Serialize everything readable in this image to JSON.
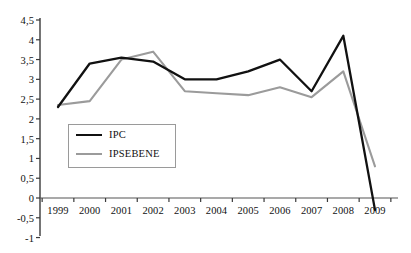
{
  "chart_data": {
    "type": "line",
    "title": "",
    "subtitle": "",
    "xlabel": "",
    "ylabel": "",
    "categories": [
      "1999",
      "2000",
      "2001",
      "2002",
      "2003",
      "2004",
      "2005",
      "2006",
      "2007",
      "2008",
      "2009"
    ],
    "series": [
      {
        "name": "IPC",
        "color": "#111111",
        "values": [
          2.3,
          3.4,
          3.55,
          3.45,
          3.0,
          3.0,
          3.2,
          3.5,
          2.7,
          4.1,
          -0.3
        ]
      },
      {
        "name": "IPSEBENE",
        "color": "#9b9b9b",
        "values": [
          2.35,
          2.45,
          3.5,
          3.7,
          2.7,
          2.65,
          2.6,
          2.8,
          2.55,
          3.2,
          0.8
        ]
      }
    ],
    "ylim": [
      -1,
      4.5
    ],
    "ytick_values": [
      4.5,
      4,
      3.5,
      3,
      2.5,
      2,
      1.5,
      1,
      0.5,
      0,
      -0.5,
      -1
    ],
    "ytick_labels": [
      "4,5",
      "4",
      "3,5",
      "3",
      "2,5",
      "2",
      "1,5",
      "1",
      "0,5",
      "0",
      "-0,5",
      "-1"
    ],
    "grid": false,
    "zero_line": true,
    "legend_position": "inside-left"
  },
  "legend": {
    "entries": [
      {
        "label": "IPC"
      },
      {
        "label": "IPSEBENE"
      }
    ]
  }
}
